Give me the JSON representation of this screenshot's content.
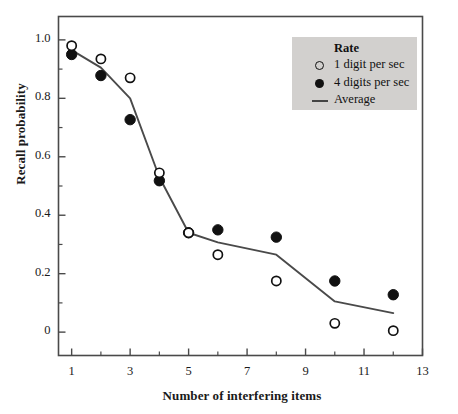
{
  "chart_data": {
    "type": "scatter",
    "title": "",
    "xlabel": "Number of interfering items",
    "ylabel": "Recall probability",
    "xlim": [
      0.55,
      13
    ],
    "ylim": [
      -0.08,
      1.08
    ],
    "xticks": [
      1,
      3,
      5,
      7,
      9,
      11,
      13
    ],
    "xtick_labels": [
      "1",
      "3",
      "5",
      "7",
      "9",
      "11",
      "13"
    ],
    "xminor_ticks": [
      2,
      4,
      6,
      8,
      10,
      12
    ],
    "yticks": [
      0,
      0.2,
      0.4,
      0.6,
      0.8,
      1.0
    ],
    "ytick_labels": [
      "0",
      "0.2",
      "0.4",
      "0.6",
      "0.8",
      "1.0"
    ],
    "yminor_ticks": [
      0.1,
      0.3,
      0.5,
      0.7,
      0.9
    ],
    "grid": false,
    "legend_position": "top-right",
    "legend_title": "Rate",
    "series": [
      {
        "name": "1 digit per sec",
        "marker": "open-circle",
        "color": "#111111",
        "x": [
          1,
          2,
          3,
          4,
          5,
          6,
          8,
          10,
          12
        ],
        "y": [
          0.98,
          0.935,
          0.87,
          0.545,
          0.34,
          0.265,
          0.175,
          0.03,
          0.005
        ]
      },
      {
        "name": "4 digits per sec",
        "marker": "filled-circle",
        "color": "#111111",
        "x": [
          1,
          2,
          3,
          4,
          5,
          6,
          8,
          10,
          12
        ],
        "y": [
          0.95,
          0.878,
          0.727,
          0.518,
          0.34,
          0.35,
          0.325,
          0.175,
          0.128
        ]
      },
      {
        "name": "Average",
        "marker": "line",
        "color": "#4a4a4a",
        "x": [
          1,
          2,
          3,
          4,
          5,
          6,
          8,
          10,
          12
        ],
        "y": [
          0.965,
          0.905,
          0.8,
          0.53,
          0.34,
          0.307,
          0.265,
          0.105,
          0.065
        ]
      }
    ]
  },
  "axes": {
    "ylabel": "Recall probability",
    "xlabel": "Number of interfering items"
  },
  "legend": {
    "title": "Rate",
    "entries": [
      {
        "label": "1 digit per sec",
        "key": "open-circle-icon"
      },
      {
        "label": "4 digits per sec",
        "key": "filled-circle-icon"
      },
      {
        "label": "Average",
        "key": "line-swatch-icon"
      }
    ]
  },
  "ytick_labels": [
    "1.0",
    "0.8",
    "0.6",
    "0.4",
    "0.2",
    "0"
  ],
  "xtick_labels": [
    "1",
    "3",
    "5",
    "7",
    "9",
    "11",
    "13"
  ]
}
